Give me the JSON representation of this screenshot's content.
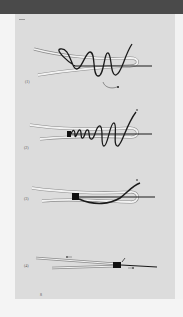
{
  "page": {
    "header_bar_color": "#4a4a4a",
    "page_background": "#dcdcdc",
    "page_number": "8"
  },
  "figure": {
    "steps": [
      {
        "label": "(1)",
        "description": "Tag end wrapped loosely around doubled line several times"
      },
      {
        "label": "(2)",
        "description": "Turns tightened into coils, tag end pulled upward"
      },
      {
        "label": "(3)",
        "description": "Coils snugged into compact barrel, tag end through loop"
      },
      {
        "label": "(4)",
        "description": "Finished knot pulled tight, lines drawn in opposite directions"
      }
    ],
    "colors": {
      "main_line": "#1a1a1a",
      "doubled_line_outline": "#f2f2f2",
      "doubled_line_edge": "#8a8a8a"
    }
  }
}
